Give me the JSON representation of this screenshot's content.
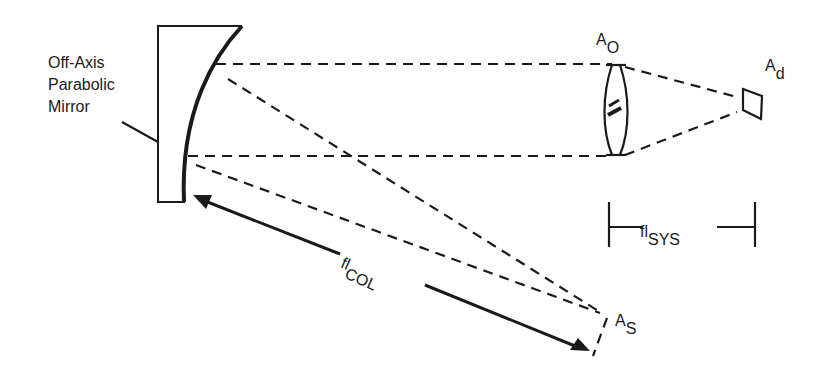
{
  "diagram": {
    "type": "optical-schematic",
    "labels": {
      "mirror_line1": "Off-Axis",
      "mirror_line2": "Parabolic",
      "mirror_line3": "Mirror",
      "aperture_objective_main": "A",
      "aperture_objective_sub": "O",
      "aperture_detector_main": "A",
      "aperture_detector_sub": "d",
      "aperture_source_main": "A",
      "aperture_source_sub": "S",
      "fl_sys_main": "fl",
      "fl_sys_sub": "SYS",
      "fl_col_main": "fl",
      "fl_col_sub": "COL"
    },
    "elements": [
      "off-axis-parabolic-mirror",
      "objective-lens",
      "detector",
      "source-aperture",
      "collimator-focal-length-arrow",
      "system-focal-length-bracket",
      "dashed-ray-paths"
    ]
  }
}
